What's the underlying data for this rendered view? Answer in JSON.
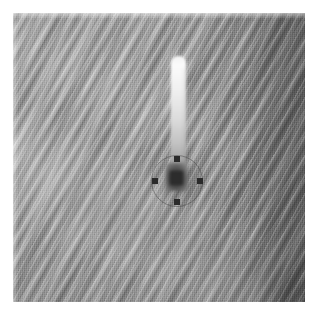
{
  "figure": {
    "kind": "grayscale-remote-sensing-image",
    "title": "",
    "caption": "",
    "canvas": {
      "width": 318,
      "height": 317,
      "background": "#ffffff"
    },
    "plate": {
      "left": 13,
      "top": 13,
      "width": 292,
      "height": 289,
      "base_gray": "#9d9d9d",
      "description": "Grayscale surface scene with fine diagonal ripple / dune striping running from lower-left to upper-right; brighter on the left half, noticeably darker vertical band along the right margin."
    },
    "tone": {
      "background_mid_gray": "#9d9d9d",
      "highlight_gray": "#e8e8e8",
      "shadow_gray": "#6f6f6f",
      "brightest_white": "#fbfbfb",
      "darkest_black": "#2a2a2a",
      "right_band_gray": "#8a8a8a"
    },
    "features": [
      {
        "name": "bright-streak",
        "label": "Bright linear streak / tail",
        "shape": "vertical elongated bright lobe",
        "x": 171,
        "y": 56,
        "width": 15,
        "height": 112,
        "peak_gray": "#fbfbfb",
        "notes": "Brightest at the top, fading downward into the dark pit."
      },
      {
        "name": "dark-pit",
        "label": "Dark pit / crater",
        "shape": "irregular dark blob",
        "x": 166,
        "y": 163,
        "width": 22,
        "height": 28,
        "core_gray": "#2c2c2c",
        "notes": "Sits at the base of the bright streak, centered inside the annotation circle."
      }
    ],
    "annotations": {
      "circle": {
        "name": "annotation-circle",
        "center_x": 177,
        "center_y": 181,
        "radius": 26,
        "stroke": "#3c3c3c",
        "stroke_width": 1,
        "style": "faint thin outline"
      },
      "markers": [
        {
          "name": "marker-top",
          "position": "top",
          "center_x": 177,
          "center_y": 159,
          "size": 6,
          "color": "#2b2b2b"
        },
        {
          "name": "marker-left",
          "position": "left",
          "center_x": 155,
          "center_y": 181,
          "size": 6,
          "color": "#2b2b2b"
        },
        {
          "name": "marker-right",
          "position": "right",
          "center_x": 200,
          "center_y": 181,
          "size": 6,
          "color": "#2b2b2b"
        },
        {
          "name": "marker-bottom",
          "position": "bottom",
          "center_x": 177,
          "center_y": 202,
          "size": 6,
          "color": "#2b2b2b"
        }
      ],
      "marker_count": 4,
      "marker_shape": "filled square"
    }
  }
}
